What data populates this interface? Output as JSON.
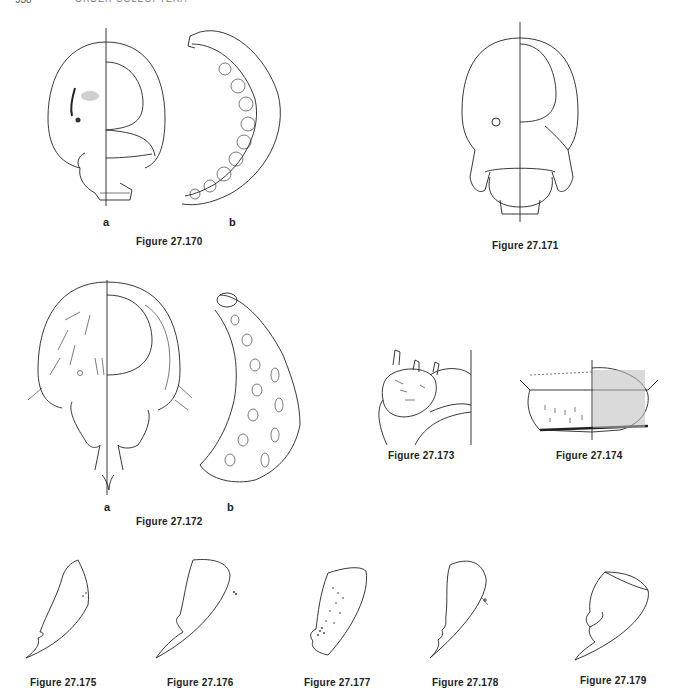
{
  "page": {
    "running_head_page": "938",
    "running_head_title": "ORDER COLEOPTERA"
  },
  "figures": [
    {
      "id": "fig-27-170",
      "caption": "Figure 27.170",
      "parts": [
        "a",
        "b"
      ],
      "description": "larval head (frontal, half-dorsal/half-ventral) and whole larva, lateral"
    },
    {
      "id": "fig-27-171",
      "caption": "Figure 27.171",
      "parts": [],
      "description": "larval head, frontal"
    },
    {
      "id": "fig-27-172",
      "caption": "Figure 27.172",
      "parts": [
        "a",
        "b"
      ],
      "description": "larval head with setae and whole C-shaped larva"
    },
    {
      "id": "fig-27-173",
      "caption": "Figure 27.173",
      "parts": [],
      "description": "detail of labrum/mouthparts with spines"
    },
    {
      "id": "fig-27-174",
      "caption": "Figure 27.174",
      "parts": [],
      "description": "labrum, split dorsal/ventral view"
    },
    {
      "id": "fig-27-175",
      "caption": "Figure 27.175",
      "parts": [],
      "description": "mandible outline"
    },
    {
      "id": "fig-27-176",
      "caption": "Figure 27.176",
      "parts": [],
      "description": "mandible outline"
    },
    {
      "id": "fig-27-177",
      "caption": "Figure 27.177",
      "parts": [],
      "description": "mandible outline with stippling"
    },
    {
      "id": "fig-27-178",
      "caption": "Figure 27.178",
      "parts": [],
      "description": "mandible outline"
    },
    {
      "id": "fig-27-179",
      "caption": "Figure 27.179",
      "parts": [],
      "description": "mandible outline"
    }
  ],
  "labels": {
    "a": "a",
    "b": "b"
  }
}
